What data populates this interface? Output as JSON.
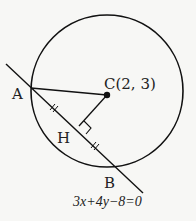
{
  "diagram": {
    "type": "geometry",
    "colors": {
      "stroke": "#111111",
      "text": "#222222",
      "background": "#f7f7f5"
    },
    "circle": {
      "center_label": "C(2, 3)",
      "center_name": "C",
      "center_coords": [
        2,
        3
      ]
    },
    "points": {
      "A": {
        "label": "A"
      },
      "B": {
        "label": "B"
      },
      "H": {
        "label": "H"
      }
    },
    "line": {
      "equation": "3x+4y−8=0",
      "equation_parts": [
        "3",
        "x",
        "+4",
        "y",
        "−8=0"
      ]
    },
    "marks": {
      "right_angle_at": "H",
      "equal_segments": [
        "AH",
        "HB"
      ]
    }
  }
}
